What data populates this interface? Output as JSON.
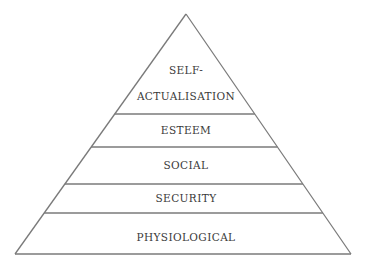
{
  "diagram": {
    "type": "pyramid",
    "apex": [
      186,
      14
    ],
    "base_left": [
      15,
      254
    ],
    "base_right": [
      351,
      254
    ],
    "colors": {
      "line": "#7a7a7a",
      "text": "#3a3a3a",
      "background": "#ffffff"
    },
    "levels": [
      {
        "label_line1": "SELF-",
        "label_line2": "ACTUALISATION",
        "top_y": 14,
        "bottom_y": 114
      },
      {
        "label": "ESTEEM",
        "top_y": 114,
        "bottom_y": 147
      },
      {
        "label": "SOCIAL",
        "top_y": 147,
        "bottom_y": 184
      },
      {
        "label": "SECURITY",
        "top_y": 184,
        "bottom_y": 213
      },
      {
        "label": "PHYSIOLOGICAL",
        "top_y": 213,
        "bottom_y": 254
      }
    ]
  }
}
